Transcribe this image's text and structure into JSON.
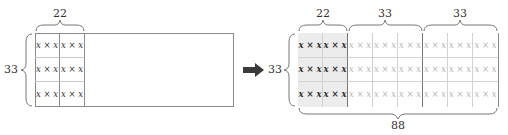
{
  "left_figure": {
    "top_label": "22",
    "side_label": "33",
    "cell_text": "x × x",
    "rows": 3,
    "filled_columns": 2
  },
  "arrow": {
    "direction": "right"
  },
  "right_figure": {
    "side_label": "33",
    "top_segments": [
      {
        "label": "22",
        "columns": 2
      },
      {
        "label": "33",
        "columns": 3
      },
      {
        "label": "33",
        "columns": 3
      }
    ],
    "bottom_label": "88",
    "cell_text": "x × x",
    "rows": 3,
    "columns": 8,
    "shaded_columns": 2
  },
  "colors": {
    "border": "#8a8a8a",
    "shaded_fill": "#ececec",
    "dark_text": "#333333",
    "light_text": "#b5b5b5",
    "arrow": "#3a3a3a"
  }
}
